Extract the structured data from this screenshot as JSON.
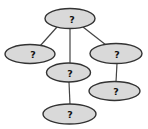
{
  "diagram": {
    "background_color": "#ffffff",
    "node_fill_color": "#d9d9d9",
    "node_stroke_color": "#333333",
    "edge_color": "#444444",
    "label_color": "#111111",
    "nodes": [
      {
        "id": "root",
        "label": "?",
        "cx": 70,
        "cy": 18.5,
        "rx": 25,
        "ry": 10,
        "lx": 72
      },
      {
        "id": "left",
        "label": "?",
        "cx": 30,
        "cy": 54,
        "rx": 25,
        "ry": 9.5,
        "lx": 33
      },
      {
        "id": "right",
        "label": "?",
        "cx": 116,
        "cy": 53.5,
        "rx": 26,
        "ry": 10,
        "lx": 117
      },
      {
        "id": "middle",
        "label": "?",
        "cx": 68.5,
        "cy": 72.5,
        "rx": 22,
        "ry": 9.5,
        "lx": 70
      },
      {
        "id": "right-child",
        "label": "?",
        "cx": 114.5,
        "cy": 91,
        "rx": 25.5,
        "ry": 9.5,
        "lx": 116
      },
      {
        "id": "middle-child",
        "label": "?",
        "cx": 69.5,
        "cy": 114,
        "rx": 26.5,
        "ry": 10,
        "lx": 70
      }
    ],
    "edges": [
      {
        "from": "root",
        "to": "left",
        "x1": 57,
        "y1": 27,
        "x2": 40,
        "y2": 46
      },
      {
        "from": "root",
        "to": "middle",
        "x1": 70,
        "y1": 28.5,
        "x2": 70,
        "y2": 63.5
      },
      {
        "from": "root",
        "to": "right",
        "x1": 83,
        "y1": 27,
        "x2": 106,
        "y2": 45
      },
      {
        "from": "right",
        "to": "right-child",
        "x1": 117,
        "y1": 63.5,
        "x2": 116,
        "y2": 82
      },
      {
        "from": "middle",
        "to": "middle-child",
        "x1": 69,
        "y1": 82,
        "x2": 70,
        "y2": 104.5
      }
    ]
  }
}
